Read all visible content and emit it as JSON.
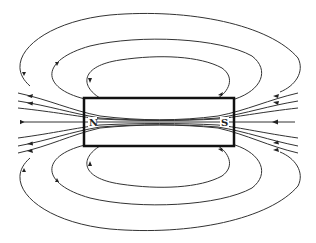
{
  "diagram": {
    "magnet": {
      "north_label": "N",
      "south_label": "S"
    },
    "colors": {
      "lines": "#333333",
      "magnet_outline": "#111111",
      "background": "#ffffff"
    },
    "field_direction": "S to N inside magnet, N to S outside (arrows point leftward at ends, rightward-return loops)"
  }
}
